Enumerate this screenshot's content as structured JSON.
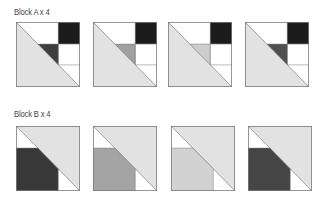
{
  "sections": [
    {
      "label": "Block A x 4",
      "type": "A",
      "blocks": [
        {
          "triangle_color": "#3f3f3f"
        },
        {
          "triangle_color": "#a0a0a0"
        },
        {
          "triangle_color": "#cdcdcd"
        },
        {
          "triangle_color": "#505050"
        }
      ]
    },
    {
      "label": "Block B x 4",
      "type": "B",
      "blocks": [
        {
          "square_color": "#383838"
        },
        {
          "square_color": "#a4a4a4"
        },
        {
          "square_color": "#d2d2d2"
        },
        {
          "square_color": "#454545"
        }
      ]
    }
  ],
  "colors": {
    "light": "#e2e2e2",
    "black": "#1c1c1c",
    "white": "#ffffff",
    "outline": "#7a7a7a"
  }
}
